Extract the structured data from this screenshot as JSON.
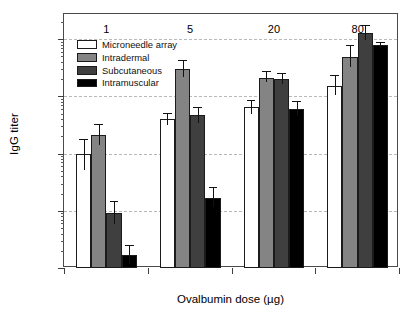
{
  "chart_data": {
    "type": "bar",
    "title": "",
    "xlabel": "Ovalbumin dose (µg)",
    "ylabel": "IgG titer",
    "categories": [
      "1",
      "5",
      "20",
      "80"
    ],
    "yscale": "log",
    "ylim": [
      100,
      2000000
    ],
    "ytick_labels": [
      "10²",
      "10³",
      "10⁴",
      "10⁵",
      "10⁶"
    ],
    "ytick_values": [
      100,
      1000,
      10000,
      100000,
      1000000
    ],
    "grid": "horizontal-dashed",
    "legend_position": "upper-left-inside",
    "series": [
      {
        "name": "Microneedle array",
        "color": "#ffffff",
        "values": [
          9800,
          40000,
          65000,
          150000
        ],
        "err_low": [
          5200,
          31000,
          50000,
          105000
        ],
        "err_high": [
          18000,
          52000,
          88000,
          235000
        ]
      },
      {
        "name": "Intradermal",
        "color": "#848484",
        "values": [
          21000,
          300000,
          210000,
          480000
        ],
        "err_low": [
          14000,
          215000,
          175000,
          330000
        ],
        "err_high": [
          33000,
          430000,
          275000,
          790000
        ]
      },
      {
        "name": "Subcutaneous",
        "color": "#3f3f3f",
        "values": [
          920,
          47000,
          200000,
          1300000
        ],
        "err_low": [
          580,
          34000,
          163000,
          980000
        ],
        "err_high": [
          1500,
          66000,
          258000,
          1800000
        ]
      },
      {
        "name": "Intramuscular",
        "color": "#000000",
        "values": [
          170,
          1700,
          60000,
          800000
        ],
        "err_low": [
          118,
          1150,
          45000,
          700000
        ],
        "err_high": [
          255,
          2600,
          83000,
          900000
        ]
      }
    ]
  },
  "axis": {
    "y_title": "IgG titer",
    "x_title": "Ovalbumin dose (µg)"
  }
}
